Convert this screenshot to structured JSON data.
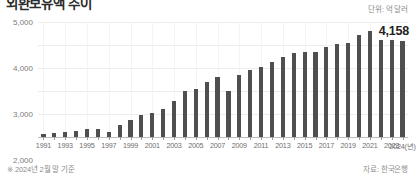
{
  "title": "외환보유액 추이",
  "unit_label": "단위: 억 달러",
  "callout_value": "4,158",
  "footnote_left": "※ 2024년 2월 말 기준",
  "footnote_right": "자료: 한국은행",
  "colors": {
    "bar": "#4f4f4f",
    "grid": "#ededed",
    "baseline": "#bdbdbd",
    "tick_text": "#7d7d7d",
    "callout_text": "#222222",
    "caption_text": "#8a8a8a"
  },
  "chart_data": {
    "type": "bar",
    "title": "외환보유액 추이",
    "subtitle": "",
    "xlabel": "(년)",
    "ylabel": "",
    "unit": "억 달러",
    "ylim": [
      0,
      5000
    ],
    "yticks": [
      0,
      1000,
      2000,
      3000,
      4000,
      5000
    ],
    "ytick_labels": [
      "0",
      "1,000",
      "2,000",
      "3,000",
      "4,000",
      "5,000"
    ],
    "grid": true,
    "legend": "none",
    "xtick_labels": [
      "1991",
      "1993",
      "1995",
      "1997",
      "1999",
      "2001",
      "2003",
      "2005",
      "2007",
      "2009",
      "2011",
      "2013",
      "2015",
      "2017",
      "2019",
      "2021",
      "2023",
      "2024(년)"
    ],
    "categories": [
      "1991",
      "1992",
      "1993",
      "1994",
      "1995",
      "1996",
      "1997",
      "1998",
      "1999",
      "2000",
      "2001",
      "2002",
      "2003",
      "2004",
      "2005",
      "2006",
      "2007",
      "2008",
      "2009",
      "2010",
      "2011",
      "2012",
      "2013",
      "2014",
      "2015",
      "2016",
      "2017",
      "2018",
      "2019",
      "2020",
      "2021",
      "2022",
      "2023",
      "2024"
    ],
    "values": [
      137,
      170,
      202,
      256,
      327,
      332,
      204,
      520,
      741,
      962,
      1028,
      1214,
      1554,
      1991,
      2104,
      2390,
      2622,
      2012,
      2700,
      2916,
      3064,
      3270,
      3465,
      3636,
      3680,
      3711,
      3893,
      4037,
      4088,
      4431,
      4631,
      4232,
      4201,
      4158
    ],
    "annotations": [
      {
        "label": "4,158",
        "category": "2024",
        "value": 4158
      }
    ],
    "source": "자료: 한국은행",
    "note": "※ 2024년 2월 말 기준"
  }
}
